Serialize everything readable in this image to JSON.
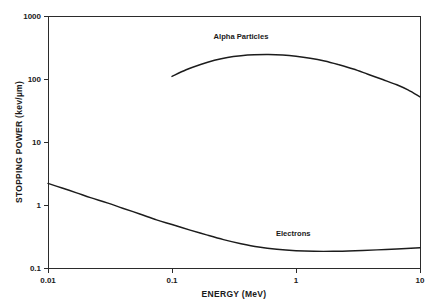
{
  "chart_data": {
    "type": "line",
    "title": "",
    "xlabel": "ENERGY (MeV)",
    "ylabel": "STOPPING POWER (kev/µm)",
    "xscale": "log",
    "yscale": "log",
    "xlim": [
      0.01,
      10
    ],
    "ylim": [
      0.1,
      1000
    ],
    "grid": false,
    "legend_position": "inline-annotation",
    "xticks": [
      0.01,
      0.1,
      1,
      10
    ],
    "xtick_labels": [
      "0.01",
      "0.1",
      "1",
      "10"
    ],
    "yticks": [
      0.1,
      1,
      10,
      100,
      1000
    ],
    "ytick_labels": [
      "0.1",
      "1",
      "10",
      "100",
      "1000"
    ],
    "series": [
      {
        "name": "Alpha Particles",
        "label_x": 0.36,
        "label_y": 430,
        "x": [
          0.1,
          0.13,
          0.17,
          0.22,
          0.28,
          0.36,
          0.46,
          0.6,
          0.78,
          1.0,
          1.3,
          1.7,
          2.2,
          2.9,
          3.8,
          5.0,
          6.5,
          8.0,
          10.0
        ],
        "y": [
          110,
          140,
          170,
          198,
          220,
          234,
          242,
          244,
          240,
          230,
          214,
          193,
          169,
          144,
          119,
          98,
          81,
          67,
          52
        ]
      },
      {
        "name": "Electrons",
        "label_x": 0.95,
        "label_y": 0.32,
        "x": [
          0.01,
          0.013,
          0.017,
          0.022,
          0.03,
          0.04,
          0.055,
          0.075,
          0.1,
          0.14,
          0.19,
          0.26,
          0.36,
          0.5,
          0.7,
          1.0,
          1.4,
          2.0,
          3.0,
          4.5,
          6.5,
          10.0
        ],
        "y": [
          2.2,
          1.86,
          1.56,
          1.31,
          1.08,
          0.89,
          0.72,
          0.58,
          0.49,
          0.4,
          0.335,
          0.282,
          0.243,
          0.215,
          0.198,
          0.188,
          0.184,
          0.184,
          0.188,
          0.194,
          0.2,
          0.21
        ]
      }
    ]
  }
}
